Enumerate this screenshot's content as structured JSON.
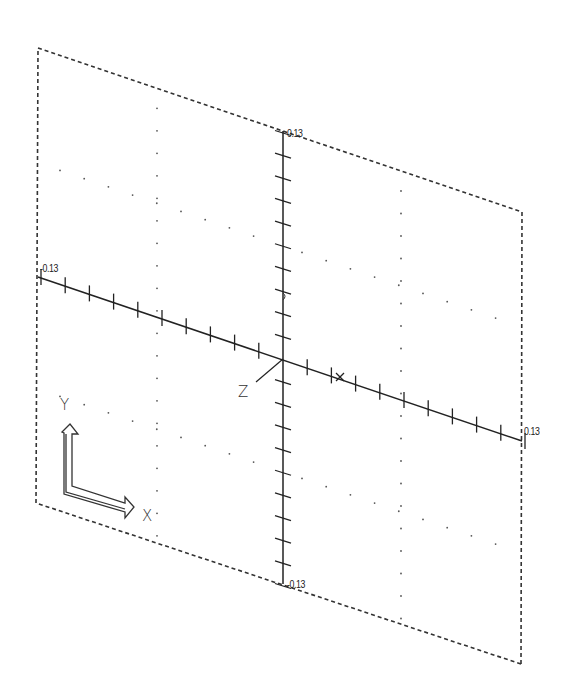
{
  "view": {
    "type": "cad-axis-view",
    "frame_corners": {
      "top_left": [
        38,
        48
      ],
      "top_right": [
        522,
        212
      ],
      "bottom_right": [
        521,
        664
      ],
      "bottom_left": [
        36,
        503
      ]
    },
    "colors": {
      "line": "#222222",
      "frame": "#333333",
      "dots": "#555555",
      "background": "#ffffff"
    }
  },
  "axes": {
    "vertical": {
      "top_label": "0.13",
      "bottom_label": "-0.13",
      "ticks_per_half": 10
    },
    "horizontal": {
      "left_label": "-0.13",
      "right_label": "0.13",
      "ticks_per_half": 10,
      "marker_label": "X"
    },
    "z_label": "Z"
  },
  "ucs_icon": {
    "y_label": "Y",
    "x_label": "X"
  }
}
